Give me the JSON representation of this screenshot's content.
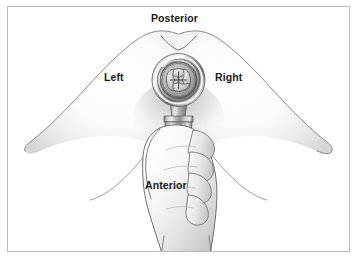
{
  "figure": {
    "border_color": "#b9b9b9",
    "background_color": "#ffffff",
    "ink_color": "#6e6e6e",
    "text_color": "#1a1a1a"
  },
  "labels": {
    "posterior": "Posterior",
    "left": "Left",
    "right": "Right",
    "anterior": "Anterior"
  },
  "instrument": {
    "name": "surgical-access-port",
    "head": "valve-ring",
    "aperture": "four-lobed-cross-valve",
    "shaft": "ribbed-cylindrical-collar",
    "metal_light": "#f2f2f2",
    "metal_mid": "#9a9a9a",
    "metal_dark": "#5a5a5a"
  },
  "anatomy": {
    "left_lobe": "left-gluteal-lobe",
    "right_lobe": "right-gluteal-lobe",
    "cleft": "gluteal-cleft-notch",
    "hand": "gripping-hand",
    "fingers": 4,
    "skin_light": "#ffffff",
    "skin_shadow": "#d2d2d2"
  }
}
